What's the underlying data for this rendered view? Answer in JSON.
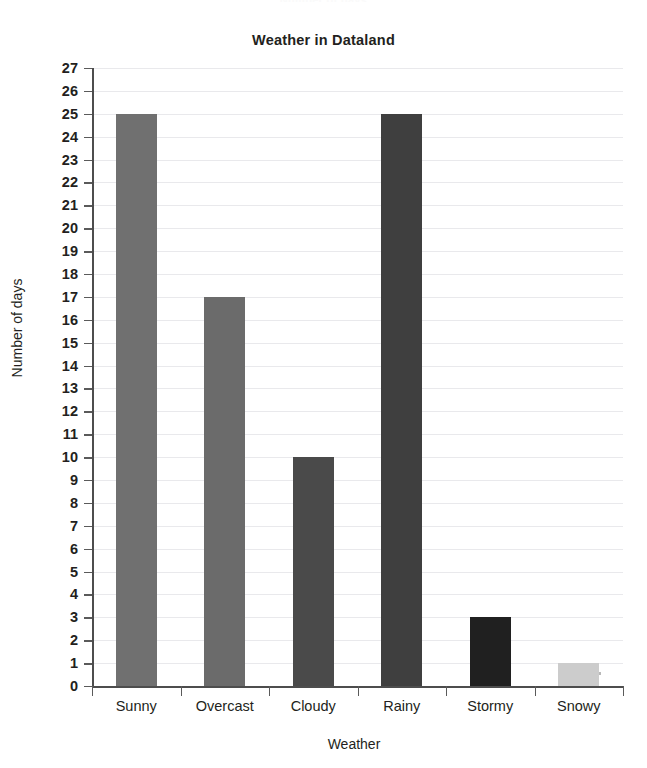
{
  "figure": {
    "top_artifact_text": "Number of days",
    "background": "#ffffff"
  },
  "chart_data": {
    "type": "bar",
    "title": "Weather in Dataland",
    "xlabel": "Weather",
    "ylabel": "Number of days",
    "categories": [
      "Sunny",
      "Overcast",
      "Cloudy",
      "Rainy",
      "Stormy",
      "Snowy"
    ],
    "values": [
      25,
      17,
      10,
      25,
      3,
      1
    ],
    "bar_colors": [
      "#707070",
      "#6b6b6b",
      "#4a4a4a",
      "#3f3f3f",
      "#202020",
      "#cccccc"
    ],
    "ylim": [
      0,
      27
    ],
    "ytick_step": 1,
    "ytick_labels": [
      "0",
      "1",
      "2",
      "3",
      "4",
      "5",
      "6",
      "7",
      "8",
      "9",
      "10",
      "11",
      "12",
      "13",
      "14",
      "15",
      "16",
      "17",
      "18",
      "19",
      "20",
      "21",
      "22",
      "23",
      "24",
      "25",
      "26",
      "27"
    ],
    "grid": true,
    "grid_axis": "y",
    "grid_color": "#e9e9ec",
    "legend": false,
    "axis_color": "#4d4d4d",
    "text_color": "#231f20"
  }
}
